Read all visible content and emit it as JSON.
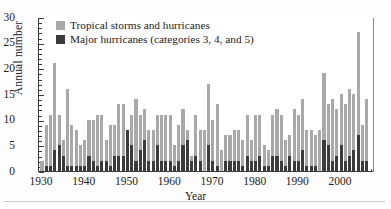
{
  "chart_data": {
    "type": "bar",
    "subtype": "stacked-bar",
    "title": "",
    "xlabel": "Year",
    "ylabel": "Annual number",
    "xlim": [
      1929.3,
      2007.7
    ],
    "ylim": [
      0,
      30
    ],
    "ytick_values": [
      0,
      5,
      10,
      15,
      20,
      25,
      30
    ],
    "ytick_labels": [
      "0",
      "5",
      "10",
      "15",
      "20",
      "25",
      "30"
    ],
    "y_minor_step": 1,
    "xtick_values": [
      1930,
      1940,
      1950,
      1960,
      1970,
      1980,
      1990,
      2000
    ],
    "xtick_labels": [
      "1930",
      "1940",
      "1950",
      "1960",
      "1970",
      "1980",
      "1990",
      "2000"
    ],
    "x_minor_step": 1,
    "grid": false,
    "legend_position": "top-left-inside",
    "colors": {
      "tropical_storms_and_hurricanes": "#a9a9a9",
      "major_hurricanes": "#3b3b3b",
      "axis": "#3a3a3a",
      "background": "#ffffff"
    },
    "legend": [
      "Tropical storms and hurricanes",
      "Major hurricanes (categories 3, 4, and 5)"
    ],
    "series": [
      {
        "name": "Tropical storms and hurricanes",
        "color": "#a9a9a9",
        "stacked_total": true,
        "values": [
          2,
          9,
          11,
          21,
          11,
          6,
          16,
          9,
          8,
          5,
          6,
          10,
          10,
          11,
          11,
          6,
          9,
          9,
          13,
          13,
          7,
          11,
          14,
          11,
          12,
          8,
          8,
          11,
          11,
          11,
          11,
          5,
          9,
          12,
          8,
          3,
          11,
          8,
          8,
          17,
          10,
          13,
          4,
          7,
          7,
          8,
          8,
          6,
          11,
          6,
          11,
          11,
          5,
          4,
          11,
          12,
          11,
          6,
          7,
          12,
          11,
          14,
          8,
          8,
          7,
          8,
          19,
          13,
          14,
          12,
          15,
          13,
          16,
          15,
          27,
          9,
          14
        ]
      },
      {
        "name": "Major hurricanes (categories 3, 4, and 5)",
        "color": "#3b3b3b",
        "values": [
          0,
          1,
          1,
          4,
          5,
          3,
          1,
          1,
          1,
          1,
          1,
          3,
          2,
          1,
          2,
          2,
          1,
          3,
          3,
          3,
          8,
          5,
          2,
          4,
          6,
          2,
          2,
          5,
          2,
          2,
          2,
          1,
          2,
          5,
          6,
          2,
          3,
          2,
          0,
          5,
          2,
          1,
          0,
          2,
          2,
          2,
          2,
          1,
          3,
          2,
          2,
          3,
          1,
          1,
          3,
          3,
          2,
          1,
          3,
          2,
          2,
          4,
          1,
          1,
          1,
          0,
          6,
          5,
          2,
          3,
          5,
          2,
          3,
          4,
          7,
          2,
          2
        ]
      }
    ],
    "years": [
      1930,
      1931,
      1932,
      1933,
      1934,
      1935,
      1936,
      1937,
      1938,
      1939,
      1940,
      1941,
      1942,
      1943,
      1944,
      1945,
      1946,
      1947,
      1948,
      1949,
      1950,
      1951,
      1952,
      1953,
      1954,
      1955,
      1956,
      1957,
      1958,
      1959,
      1960,
      1961,
      1962,
      1963,
      1964,
      1965,
      1966,
      1967,
      1968,
      1969,
      1970,
      1971,
      1972,
      1973,
      1974,
      1975,
      1976,
      1977,
      1978,
      1979,
      1980,
      1981,
      1982,
      1983,
      1984,
      1985,
      1986,
      1987,
      1988,
      1989,
      1990,
      1991,
      1992,
      1993,
      1994,
      1995,
      1996,
      1997,
      1998,
      1999,
      2000,
      2001,
      2002,
      2003,
      2004,
      2005,
      2006
    ]
  }
}
